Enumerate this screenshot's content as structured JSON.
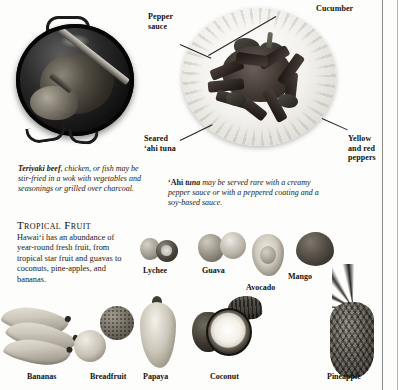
{
  "document": {
    "title": "Hawaiian Food — Teriyaki, 'Ahi Tuna and Tropical Fruit"
  },
  "photos": {
    "wok": {
      "name": "wok-with-teriyaki-beef-photo"
    },
    "plate": {
      "name": "seared-ahi-tuna-plate-photo"
    }
  },
  "callouts": [
    {
      "id": "pepper-sauce",
      "label": "Pepper\nsauce"
    },
    {
      "id": "cucumber",
      "label": "Cucumber"
    },
    {
      "id": "seared-ahi",
      "label": "Seared\n‘ahi tuna"
    },
    {
      "id": "yellow-red-peppers",
      "label": "Yellow\nand red\npeppers"
    }
  ],
  "callout_labels": {
    "pepper_sauce_line1": "Pepper",
    "pepper_sauce_line2": "sauce",
    "cucumber": "Cucumber",
    "seared_line1": "Seared",
    "seared_line2": "‘ahi tuna",
    "peppers_line1": "Yellow",
    "peppers_line2": "and red",
    "peppers_line3": "peppers"
  },
  "captions": {
    "teriyaki": {
      "lead": "Teriyaki beef",
      "rest": ", chicken, or fish may be stir-fried in a wok with vegetables and seasonings or grilled over charcoal."
    },
    "ahi": {
      "lead_prefix": "‘Ahi ",
      "lead": "tuna",
      "rest": " may be served rare with a creamy pepper sauce or with a peppered coating and a soy-based sauce."
    }
  },
  "tropical_fruit": {
    "heading": "Tropical Fruit",
    "body": "Hawai‘i has an abundance of year-round fresh fruit, from tropical star fruit and guavas to coconuts, pine-apples, and bananas."
  },
  "fruit_labels": {
    "lychee": "Lychee",
    "guava": "Guava",
    "avocado": "Avocado",
    "mango": "Mango",
    "bananas": "Bananas",
    "breadfruit": "Breadfruit",
    "papaya": "Papaya",
    "coconut": "Coconut",
    "pineapple": "Pineapple"
  },
  "colors": {
    "page_background": "#fdfdfb",
    "text": "#1a1a1a",
    "rule": "#8a8a8a"
  }
}
